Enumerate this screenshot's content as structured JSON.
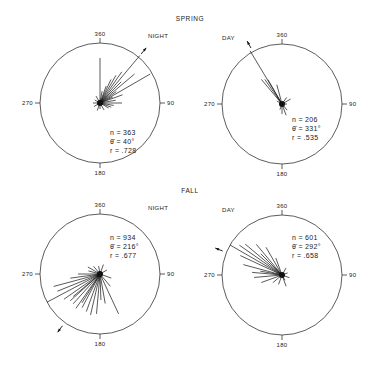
{
  "sections": {
    "spring": "SPRING",
    "fall": "FALL"
  },
  "chart_data": [
    {
      "type": "circular-rose",
      "season": "SPRING",
      "title": "NIGHT",
      "center": [
        100,
        103
      ],
      "radius": 60,
      "axis_labels": {
        "top": "360",
        "right": "90",
        "bottom": "180",
        "left": "270"
      },
      "stats": {
        "n": "n = 363",
        "theta": "θ̄ = 40°",
        "r": "r = .728"
      },
      "stats_pos": [
        110,
        135
      ],
      "title_pos": [
        148,
        38
      ],
      "mean_angle": 40,
      "rays": [
        [
          40,
          62
        ],
        [
          60,
          58
        ],
        [
          0,
          45
        ],
        [
          50,
          45
        ],
        [
          35,
          38
        ],
        [
          30,
          32
        ],
        [
          45,
          30
        ],
        [
          25,
          26
        ],
        [
          70,
          24
        ],
        [
          90,
          22
        ],
        [
          55,
          20
        ],
        [
          20,
          18
        ],
        [
          80,
          16
        ],
        [
          100,
          14
        ],
        [
          120,
          10
        ],
        [
          150,
          8
        ],
        [
          200,
          8
        ],
        [
          240,
          7
        ],
        [
          270,
          7
        ],
        [
          300,
          6
        ],
        [
          330,
          8
        ],
        [
          10,
          12
        ],
        [
          65,
          14
        ],
        [
          110,
          12
        ],
        [
          180,
          6
        ]
      ]
    },
    {
      "type": "circular-rose",
      "season": "SPRING",
      "title": "DAY",
      "center": [
        282,
        104
      ],
      "radius": 60,
      "axis_labels": {
        "top": "360",
        "right": "90",
        "bottom": "180",
        "left": "270"
      },
      "stats": {
        "n": "n = 206",
        "theta": "θ̄ = 331°",
        "r": "r = .535"
      },
      "stats_pos": [
        292,
        122
      ],
      "title_pos": [
        222,
        40
      ],
      "mean_angle": 331,
      "rays": [
        [
          329,
          62
        ],
        [
          320,
          32
        ],
        [
          325,
          30
        ],
        [
          330,
          28
        ],
        [
          345,
          20
        ],
        [
          60,
          10
        ],
        [
          35,
          8
        ],
        [
          160,
          12
        ],
        [
          180,
          10
        ],
        [
          200,
          6
        ],
        [
          300,
          6
        ],
        [
          90,
          5
        ],
        [
          140,
          8
        ]
      ]
    },
    {
      "type": "circular-rose",
      "season": "FALL",
      "title": "NIGHT",
      "center": [
        100,
        274
      ],
      "radius": 60,
      "axis_labels": {
        "top": "360",
        "right": "90",
        "bottom": "180",
        "left": "270"
      },
      "stats": {
        "n": "n = 934",
        "theta": "θ̄ = 216°",
        "r": "r = .677"
      },
      "stats_pos": [
        110,
        240
      ],
      "title_pos": [
        148,
        210
      ],
      "mean_angle": 216,
      "rays": [
        [
          242,
          60
        ],
        [
          255,
          48
        ],
        [
          248,
          46
        ],
        [
          235,
          44
        ],
        [
          228,
          40
        ],
        [
          222,
          40
        ],
        [
          215,
          42
        ],
        [
          208,
          38
        ],
        [
          200,
          40
        ],
        [
          193,
          42
        ],
        [
          185,
          40
        ],
        [
          155,
          44
        ],
        [
          230,
          35
        ],
        [
          212,
          34
        ],
        [
          262,
          30
        ],
        [
          270,
          22
        ],
        [
          285,
          12
        ],
        [
          300,
          14
        ],
        [
          320,
          10
        ],
        [
          350,
          8
        ],
        [
          20,
          10
        ],
        [
          60,
          8
        ],
        [
          110,
          12
        ],
        [
          140,
          16
        ],
        [
          170,
          30
        ],
        [
          178,
          26
        ]
      ]
    },
    {
      "type": "circular-rose",
      "season": "FALL",
      "title": "DAY",
      "center": [
        282,
        275
      ],
      "radius": 60,
      "axis_labels": {
        "top": "360",
        "right": "90",
        "bottom": "180",
        "left": "270"
      },
      "stats": {
        "n": "n = 601",
        "theta": "θ̄ = 292°",
        "r": "r = .658"
      },
      "stats_pos": [
        292,
        240
      ],
      "title_pos": [
        222,
        212
      ],
      "mean_angle": 292,
      "rays": [
        [
          300,
          60
        ],
        [
          305,
          52
        ],
        [
          310,
          48
        ],
        [
          295,
          46
        ],
        [
          285,
          40
        ],
        [
          320,
          40
        ],
        [
          330,
          32
        ],
        [
          315,
          30
        ],
        [
          275,
          30
        ],
        [
          265,
          28
        ],
        [
          250,
          22
        ],
        [
          280,
          22
        ],
        [
          340,
          18
        ],
        [
          230,
          12
        ],
        [
          200,
          10
        ],
        [
          160,
          12
        ],
        [
          110,
          8
        ],
        [
          70,
          6
        ],
        [
          30,
          8
        ],
        [
          150,
          6
        ]
      ]
    }
  ]
}
